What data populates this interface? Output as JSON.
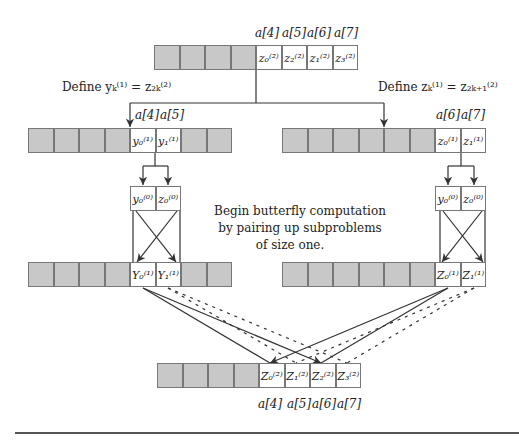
{
  "top_array": {
    "index_labels": [
      "a[4]",
      "a[5]",
      "a[6]",
      "a[7]"
    ],
    "cells": [
      "",
      "",
      "",
      "",
      "z₀⁽²⁾",
      "z₂⁽²⁾",
      "z₁⁽²⁾",
      "z₃⁽²⁾"
    ]
  },
  "define_left": "Define yₖ⁽¹⁾ = z₂ₖ⁽²⁾",
  "define_right": "Define zₖ⁽¹⁾ = z₂ₖ₊₁⁽²⁾",
  "left_array": {
    "index_labels": [
      "a[4]",
      "a[5]"
    ],
    "cells": [
      "",
      "",
      "",
      "",
      "y₀⁽¹⁾",
      "y₁⁽¹⁾",
      "",
      ""
    ]
  },
  "right_array": {
    "index_labels": [
      "a[6]",
      "a[7]"
    ],
    "cells": [
      "",
      "",
      "",
      "",
      "",
      "",
      "z₀⁽¹⁾",
      "z₁⁽¹⁾"
    ]
  },
  "left_pair": [
    "y₀⁽⁰⁾",
    "z₀⁽⁰⁾"
  ],
  "right_pair": [
    "y₀⁽⁰⁾",
    "z₀⁽⁰⁾"
  ],
  "caption": [
    "Begin butterfly computation",
    "by pairing up subproblems",
    "of size one."
  ],
  "left_result": {
    "cells": [
      "",
      "",
      "",
      "",
      "Y₀⁽¹⁾",
      "Y₁⁽¹⁾",
      "",
      ""
    ]
  },
  "right_result": {
    "cells": [
      "",
      "",
      "",
      "",
      "",
      "",
      "Z₀⁽¹⁾",
      "Z₁⁽¹⁾"
    ]
  },
  "bottom_array": {
    "cells": [
      "",
      "",
      "",
      "",
      "Z₀⁽²⁾",
      "Z₁⁽²⁾",
      "Z₂⁽²⁾",
      "Z₃⁽²⁾"
    ],
    "index_labels": [
      "a[4]",
      "a[5]",
      "a[6]",
      "a[7]"
    ]
  },
  "colors": {
    "shaded_cell": "#c8c8c8",
    "line": "#333333"
  }
}
